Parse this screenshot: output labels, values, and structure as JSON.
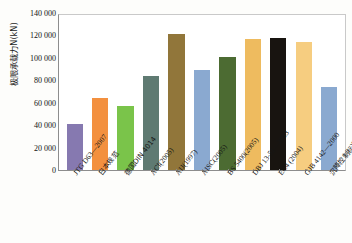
{
  "chart_data": {
    "type": "bar",
    "title": "",
    "xlabel": "",
    "ylabel": "极限承载力N(kN)",
    "ylim": [
      0,
      140000
    ],
    "ytick_labels": [
      "140 000",
      "120 000",
      "100 000",
      "80 000",
      "60 000",
      "40 000",
      "20 000",
      "0"
    ],
    "ytick_values": [
      140000,
      120000,
      100000,
      80000,
      60000,
      40000,
      20000,
      0
    ],
    "grid": false,
    "legend": "none",
    "categories": [
      "JTG D63—2007",
      "日本规范",
      "德国DIN 4014",
      "ACI(2005)",
      "AIJ(1997)",
      "AISC(2005)",
      "BS 5400(2005)",
      "DBJ 13-51—2003",
      "EC4 (2004)",
      "GJB 4142—2000",
      "沉降控制标准"
    ],
    "values": [
      42000,
      65000,
      58000,
      85000,
      123000,
      90000,
      102000,
      118000,
      119000,
      116000,
      75000
    ],
    "colors": [
      "#8679b0",
      "#f3903f",
      "#7ac44a",
      "#5f7a72",
      "#91763a",
      "#8aa9d0",
      "#4c6b32",
      "#eebb5f",
      "#181410",
      "#f6cd80",
      "#8aa9d0"
    ]
  }
}
